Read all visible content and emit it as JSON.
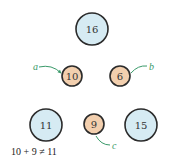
{
  "diagram": {
    "colors": {
      "big_fill": "#d6ebf3",
      "small_fill": "#f2cfae",
      "stroke": "#2b2b2b",
      "arrow": "#3a9a6a"
    },
    "nodes": [
      {
        "id": "n16",
        "value": "16",
        "kind": "large",
        "cx": 92,
        "cy": 29,
        "r": 16
      },
      {
        "id": "n10",
        "value": "10",
        "kind": "small",
        "cx": 72,
        "cy": 76,
        "r": 10
      },
      {
        "id": "n6",
        "value": "6",
        "kind": "small",
        "cx": 120,
        "cy": 76,
        "r": 10
      },
      {
        "id": "n11",
        "value": "11",
        "kind": "large",
        "cx": 46,
        "cy": 125,
        "r": 16
      },
      {
        "id": "n9",
        "value": "9",
        "kind": "small",
        "cx": 94,
        "cy": 124,
        "r": 10
      },
      {
        "id": "n15",
        "value": "15",
        "kind": "large",
        "cx": 141,
        "cy": 125,
        "r": 16
      }
    ],
    "labels": {
      "a": "a",
      "b": "b",
      "c": "c"
    },
    "equation": "10 + 9 ≠ 11"
  }
}
